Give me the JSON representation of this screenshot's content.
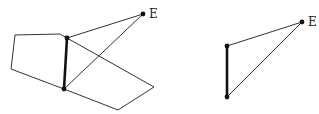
{
  "figures": [
    {
      "id": "left",
      "label_E": "E",
      "E": [
        143,
        14
      ],
      "label_pos": [
        149,
        18
      ],
      "top": [
        67,
        38
      ],
      "bottom": [
        64,
        89
      ],
      "pentagon": [
        [
          67,
          38
        ],
        [
          60,
          34
        ],
        [
          15,
          35
        ],
        [
          11,
          69
        ],
        [
          64,
          89
        ]
      ],
      "quad": [
        [
          67,
          38
        ],
        [
          154,
          87
        ],
        [
          118,
          110
        ],
        [
          64,
          89
        ]
      ]
    },
    {
      "id": "right",
      "label_E": "E",
      "E": [
        302,
        22
      ],
      "label_pos": [
        308,
        26
      ],
      "top": [
        227,
        46
      ],
      "bottom": [
        227,
        97
      ]
    }
  ]
}
